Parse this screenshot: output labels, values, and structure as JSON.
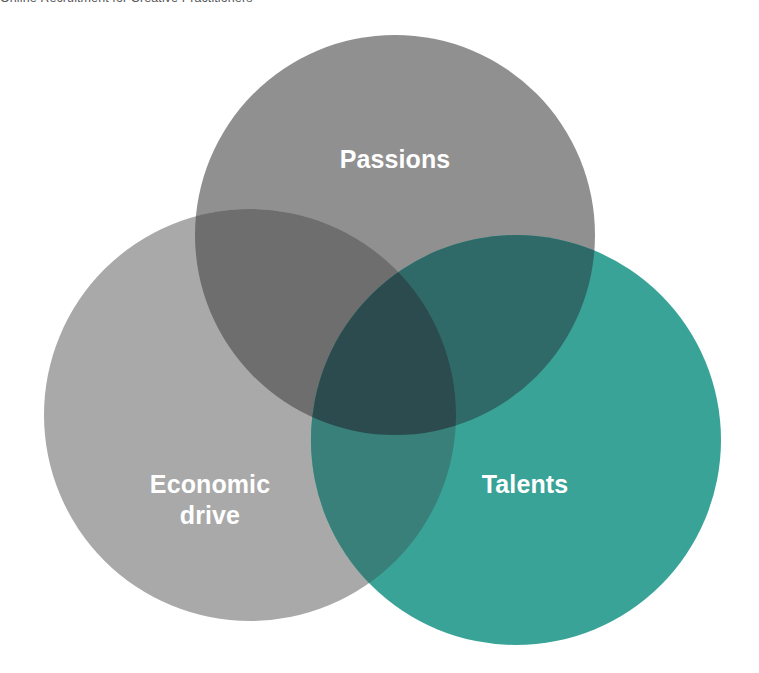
{
  "figure": {
    "caption": "Online Recruitment for Creative Practitioners",
    "background_color": "#ffffff",
    "type": "venn-diagram",
    "set_count": 3
  },
  "venn": {
    "label_color": "#ffffff",
    "sets": [
      {
        "id": "passions",
        "label": "Passions",
        "color": "#909090",
        "position": "top",
        "cx": 395,
        "cy": 221,
        "r": 200
      },
      {
        "id": "economic-drive",
        "label": "Economic\ndrive",
        "color": "#a9a9a9",
        "position": "bottom-left",
        "cx": 250,
        "cy": 401,
        "r": 206
      },
      {
        "id": "talents",
        "label": "Talents",
        "color": "#3aa397",
        "position": "bottom-right",
        "cx": 516,
        "cy": 426,
        "r": 205
      }
    ],
    "intersections": [
      {
        "id": "passions-economic-drive",
        "sets": [
          "passions",
          "economic-drive"
        ],
        "color": "#6e6e6e"
      },
      {
        "id": "passions-talents",
        "sets": [
          "passions",
          "talents"
        ],
        "color": "#2f6a69"
      },
      {
        "id": "economic-drive-talents",
        "sets": [
          "economic-drive",
          "talents"
        ],
        "color": "#39807a"
      },
      {
        "id": "passions-economic-drive-talents",
        "sets": [
          "passions",
          "economic-drive",
          "talents"
        ],
        "color": "#2b4b4e"
      }
    ]
  }
}
